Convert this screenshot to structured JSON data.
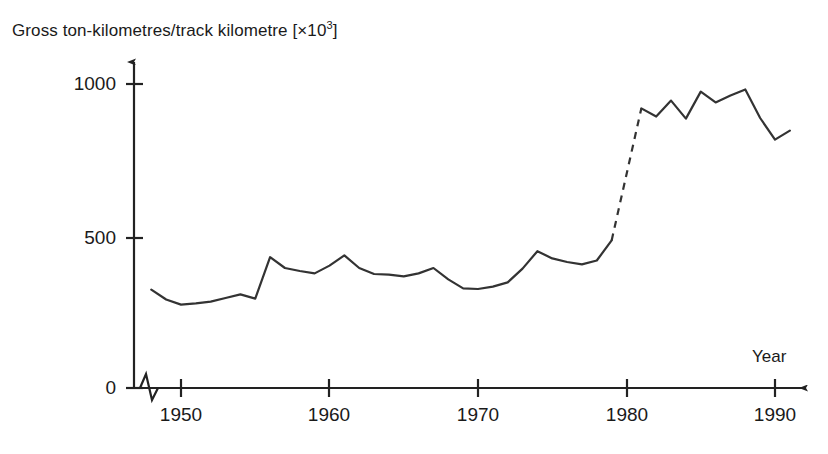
{
  "chart_data": {
    "type": "line",
    "title_plain": "Gross ton-kilometres/track kilometre",
    "title_unit_base": "[×10",
    "title_unit_exp": "3",
    "title_unit_close": "]",
    "xlabel": "Year",
    "ylabel": "Gross ton-kilometres/track kilometre [×10³]",
    "xlim": [
      1947.5,
      1991.5
    ],
    "ylim": [
      0,
      1060
    ],
    "xticks": [
      1950,
      1960,
      1970,
      1980,
      1990
    ],
    "xtick_labels": [
      "1950",
      "1960",
      "1970",
      "1980",
      "1990"
    ],
    "yticks": [
      0,
      500,
      1000
    ],
    "ytick_labels": [
      "0",
      "500",
      "1000"
    ],
    "grid": false,
    "legend": null,
    "axis_break": true,
    "axis_break_note": "zig-zag break on x-axis between origin and 1950",
    "line_color": "#333333",
    "series": [
      {
        "name": "solid-early",
        "style": "solid",
        "x": [
          1948,
          1949,
          1950,
          1951,
          1952,
          1953,
          1954,
          1955,
          1956,
          1957,
          1958,
          1959,
          1960,
          1961,
          1962,
          1963,
          1964,
          1965,
          1966,
          1967,
          1968,
          1969,
          1970,
          1971,
          1972,
          1973,
          1974,
          1975,
          1976,
          1977,
          1978,
          1979
        ],
        "values": [
          328,
          295,
          278,
          282,
          288,
          300,
          312,
          298,
          436,
          400,
          390,
          382,
          408,
          442,
          400,
          380,
          378,
          372,
          382,
          400,
          362,
          332,
          330,
          338,
          352,
          398,
          456,
          432,
          420,
          412,
          425,
          492
        ]
      },
      {
        "name": "dashed-gap",
        "style": "dashed",
        "x": [
          1979,
          1981
        ],
        "values": [
          492,
          932
        ]
      },
      {
        "name": "solid-late",
        "style": "solid",
        "x": [
          1981,
          1982,
          1983,
          1984,
          1985,
          1986,
          1987,
          1988,
          1989,
          1990,
          1991
        ],
        "values": [
          932,
          905,
          958,
          898,
          988,
          952,
          975,
          995,
          900,
          828,
          858
        ]
      }
    ]
  },
  "axis": {
    "y_title": "Gross ton-kilometres/track kilometre [×10³]",
    "x_name": "Year",
    "ytick_0": "0",
    "ytick_500": "500",
    "ytick_1000": "1000",
    "xtick_1950": "1950",
    "xtick_1960": "1960",
    "xtick_1970": "1970",
    "xtick_1980": "1980",
    "xtick_1990": "1990"
  }
}
